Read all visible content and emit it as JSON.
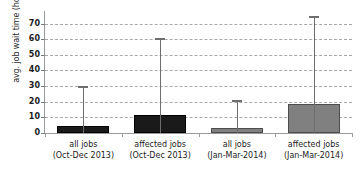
{
  "chart_data": {
    "type": "bar",
    "title": "",
    "xlabel": "",
    "ylabel": "avg. job wait time (hours)",
    "ylim": [
      0,
      78
    ],
    "yticks": [
      0,
      10,
      20,
      30,
      40,
      50,
      60,
      70
    ],
    "ytick_labels": [
      "0",
      "10",
      "20",
      "30",
      "40",
      "50",
      "60",
      "70"
    ],
    "grid": true,
    "legend": "none",
    "categories": [
      "all jobs (Oct-Dec 2013)",
      "affected jobs (Oct-Dec 2013)",
      "all jobs (Jan-Mar-2014)",
      "affected jobs (Jan-Mar-2014)"
    ],
    "category_lines": [
      {
        "line1": "all jobs",
        "line2": "(Oct-Dec 2013)"
      },
      {
        "line1": "affected jobs",
        "line2": "(Oct-Dec 2013)"
      },
      {
        "line1": "all jobs",
        "line2": "(Jan-Mar-2014)"
      },
      {
        "line1": "affected jobs",
        "line2": "(Jan-Mar-2014)"
      }
    ],
    "values": [
      4.2,
      11.3,
      3.5,
      18.3
    ],
    "error_high": [
      30.0,
      61.0,
      21.0,
      75.0
    ],
    "error_low": [
      0,
      0,
      0,
      0
    ],
    "bar_colors": [
      "#1a1a1a",
      "#1a1a1a",
      "#808080",
      "#808080"
    ],
    "bar_border_colors": [
      "#000000",
      "#000000",
      "#4d4d4d",
      "#4d4d4d"
    ],
    "errorbar_color": "#6e6e6e",
    "grid_color": "#a9a9a9",
    "axis_color": "#9a9a9a"
  }
}
